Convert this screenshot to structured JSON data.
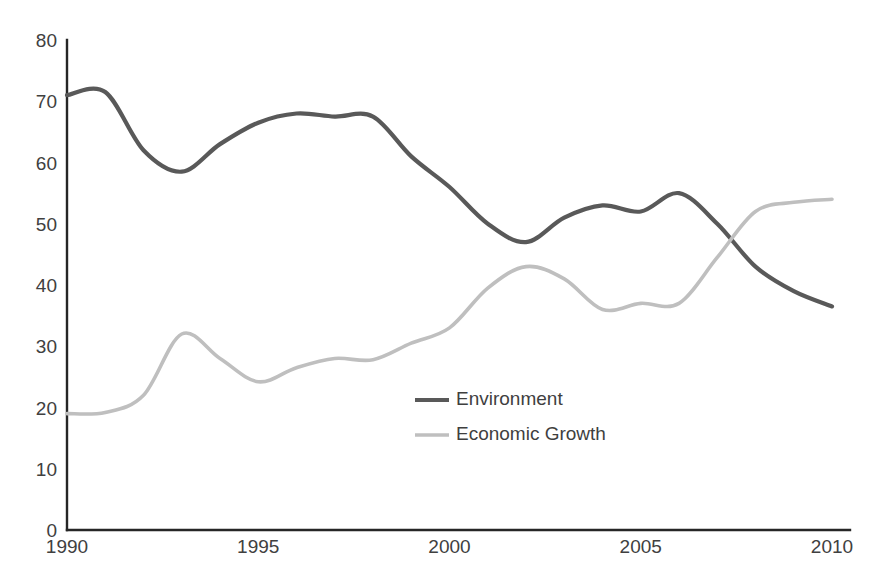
{
  "chart_data": {
    "type": "line",
    "title": "",
    "subtitle": "",
    "xlabel": "",
    "ylabel": "",
    "xlim": [
      1990,
      2010
    ],
    "ylim": [
      0,
      80
    ],
    "grid": false,
    "legend_position": "center",
    "x_ticks": [
      "1990",
      "1995",
      "2000",
      "2005",
      "2010"
    ],
    "x_tick_values": [
      1990,
      1995,
      2000,
      2005,
      2010
    ],
    "y_ticks": [
      "0",
      "10",
      "20",
      "30",
      "40",
      "50",
      "60",
      "70",
      "80"
    ],
    "y_tick_values": [
      0,
      10,
      20,
      30,
      40,
      50,
      60,
      70,
      80
    ],
    "x": [
      1990,
      1991,
      1992,
      1993,
      1994,
      1995,
      1996,
      1997,
      1998,
      1999,
      2000,
      2001,
      2002,
      2003,
      2004,
      2005,
      2006,
      2007,
      2008,
      2009,
      2010
    ],
    "series": [
      {
        "name": "Environment",
        "color": "#595959",
        "values": [
          71,
          71.5,
          62,
          58.5,
          63,
          66.5,
          68,
          67.5,
          67.5,
          61,
          56,
          50,
          47,
          51,
          53,
          52,
          55,
          50,
          43,
          39,
          36.5
        ]
      },
      {
        "name": "Economic Growth",
        "color": "#bfbfbf",
        "values": [
          19,
          19.2,
          22,
          32,
          28,
          24.2,
          26.5,
          28,
          27.8,
          30.5,
          33,
          39.5,
          43,
          41,
          36,
          37,
          37,
          44.5,
          52,
          53.5,
          54
        ]
      }
    ]
  },
  "legend": {
    "items": [
      {
        "label": "Environment",
        "color": "#595959"
      },
      {
        "label": "Economic Growth",
        "color": "#bfbfbf"
      }
    ]
  },
  "axes": {
    "x_axis_name": "year-axis",
    "y_axis_name": "value-axis"
  }
}
